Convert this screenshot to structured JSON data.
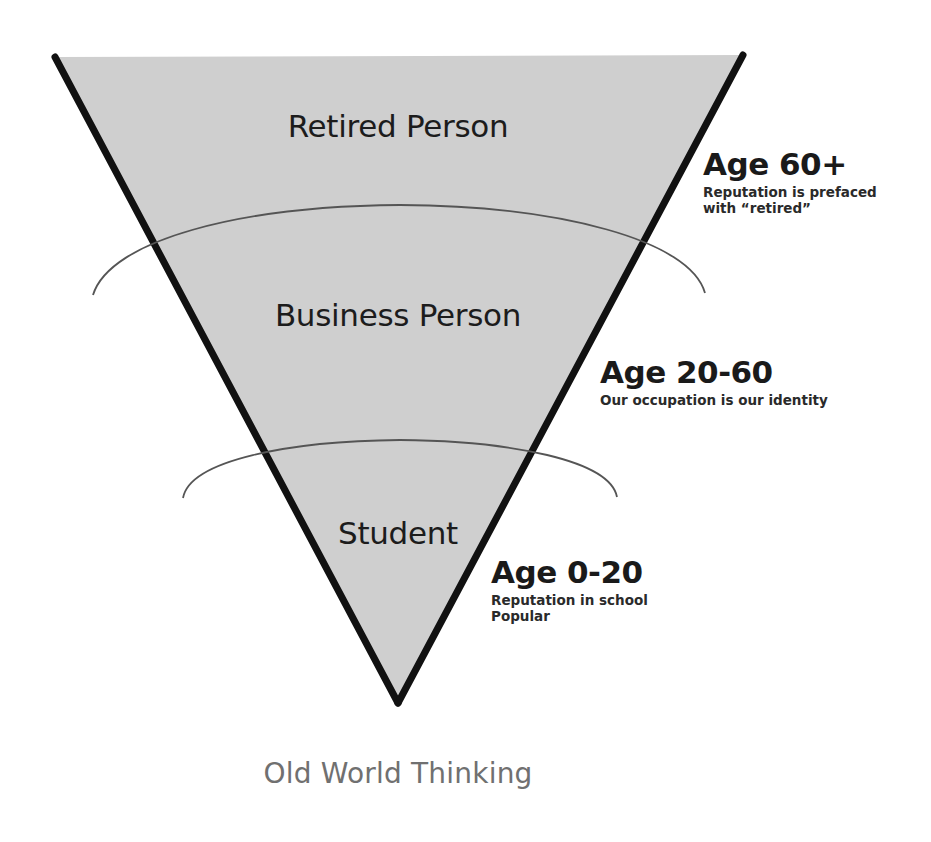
{
  "diagram": {
    "type": "inverted-pyramid",
    "colors": {
      "fill": "#cfcfcf",
      "outline": "#111111",
      "arc": "#555555",
      "caption": "#707070",
      "text": "#1c1c1c"
    },
    "tiers": [
      {
        "label": "Retired Person",
        "age": "Age 60+",
        "description_lines": [
          "Reputation is prefaced",
          "with “retired”"
        ]
      },
      {
        "label": "Business Person",
        "age": "Age 20-60",
        "description_lines": [
          "Our occupation is our identity"
        ]
      },
      {
        "label": "Student",
        "age": "Age 0-20",
        "description_lines": [
          "Reputation in school",
          "Popular"
        ]
      }
    ],
    "caption": "Old World Thinking"
  }
}
